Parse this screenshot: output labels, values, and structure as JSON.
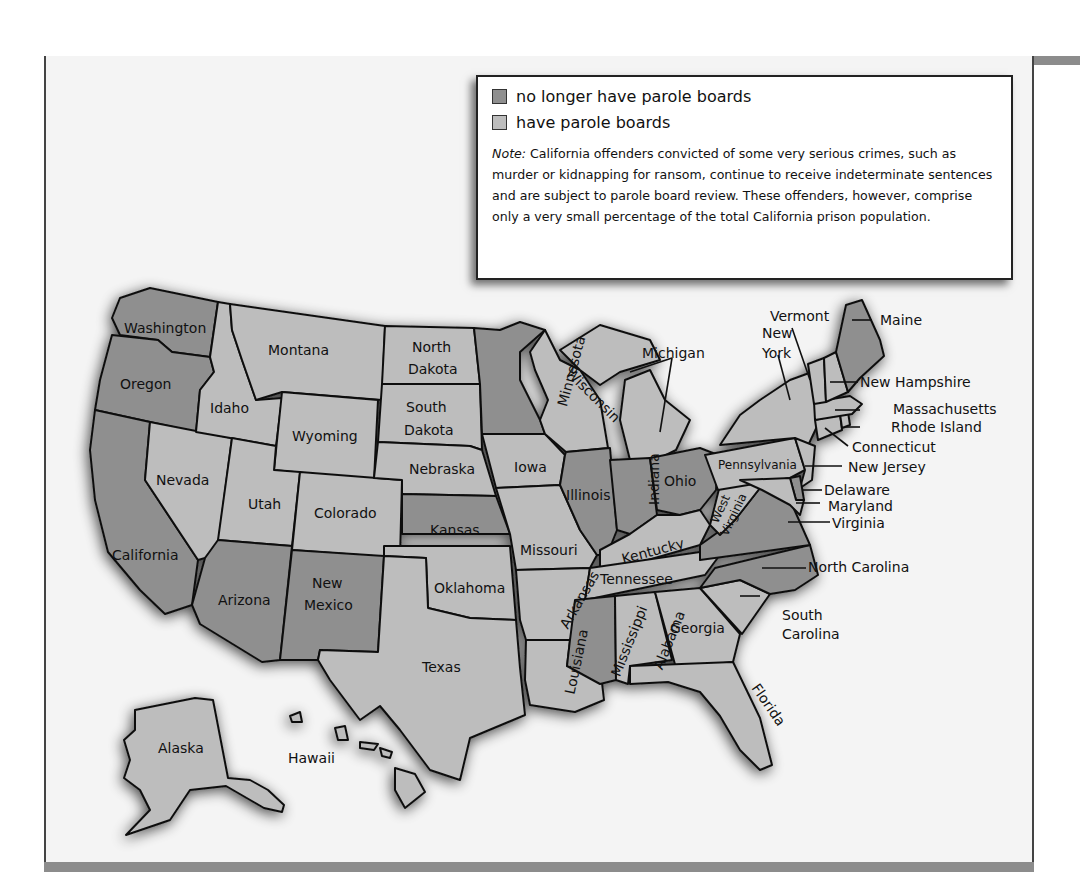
{
  "legend": {
    "items": [
      {
        "label": "no longer have parole boards",
        "color": "#8f8f8f"
      },
      {
        "label": "have parole boards",
        "color": "#bdbdbd"
      }
    ],
    "note_label": "Note:",
    "note_text": " California offenders convicted of some very serious crimes, such as murder or kidnapping for ransom, continue to receive indeterminate sentences and are subject to parole board review. These offenders, however, comprise only a very small percentage of the total California prison population."
  },
  "colors": {
    "no_parole": "#8f8f8f",
    "parole": "#bdbdbd",
    "frame_band": "#8c8c8c",
    "background": "#f4f4f4"
  },
  "states": {
    "no_parole_boards": [
      "Washington",
      "Oregon",
      "California",
      "Arizona",
      "New Mexico",
      "Kansas",
      "Minnesota",
      "Illinois",
      "Indiana",
      "Ohio",
      "Mississippi",
      "Virginia",
      "North Carolina",
      "Maine",
      "Delaware"
    ],
    "have_parole_boards": [
      "Montana",
      "Idaho",
      "Wyoming",
      "Nevada",
      "Utah",
      "Colorado",
      "North Dakota",
      "South Dakota",
      "Nebraska",
      "Oklahoma",
      "Texas",
      "Iowa",
      "Missouri",
      "Arkansas",
      "Louisiana",
      "Wisconsin",
      "Michigan",
      "Kentucky",
      "Tennessee",
      "Alabama",
      "Georgia",
      "Florida",
      "South Carolina",
      "West Virginia",
      "Pennsylvania",
      "New York",
      "Vermont",
      "New Hampshire",
      "Massachusetts",
      "Rhode Island",
      "Connecticut",
      "New Jersey",
      "Maryland",
      "Alaska",
      "Hawaii"
    ]
  },
  "labels": {
    "washington": "Washington",
    "oregon": "Oregon",
    "california": "California",
    "nevada": "Nevada",
    "idaho": "Idaho",
    "montana": "Montana",
    "wyoming": "Wyoming",
    "utah": "Utah",
    "colorado": "Colorado",
    "arizona": "Arizona",
    "new_mexico_1": "New",
    "new_mexico_2": "Mexico",
    "north_dakota_1": "North",
    "north_dakota_2": "Dakota",
    "south_dakota_1": "South",
    "south_dakota_2": "Dakota",
    "nebraska": "Nebraska",
    "kansas": "Kansas",
    "oklahoma": "Oklahoma",
    "texas": "Texas",
    "minnesota": "Minnesota",
    "iowa": "Iowa",
    "missouri": "Missouri",
    "arkansas": "Arkansas",
    "louisiana": "Louisiana",
    "wisconsin": "Wisconsin",
    "illinois": "Illinois",
    "michigan": "Michigan",
    "indiana": "Indiana",
    "ohio": "Ohio",
    "kentucky": "Kentucky",
    "tennessee": "Tennessee",
    "mississippi": "Mississippi",
    "alabama": "Alabama",
    "georgia": "Georgia",
    "florida": "Florida",
    "south_carolina_1": "South",
    "south_carolina_2": "Carolina",
    "north_carolina": "North Carolina",
    "virginia": "Virginia",
    "west_virginia_1": "West",
    "west_virginia_2": "Virginia",
    "pennsylvania": "Pennsylvania",
    "new_york_1": "New",
    "new_york_2": "York",
    "vermont": "Vermont",
    "maine": "Maine",
    "new_hampshire": "New Hampshire",
    "massachusetts": "Massachusetts",
    "rhode_island": "Rhode Island",
    "connecticut": "Connecticut",
    "new_jersey": "New Jersey",
    "delaware": "Delaware",
    "maryland": "Maryland",
    "alaska": "Alaska",
    "hawaii": "Hawaii"
  }
}
